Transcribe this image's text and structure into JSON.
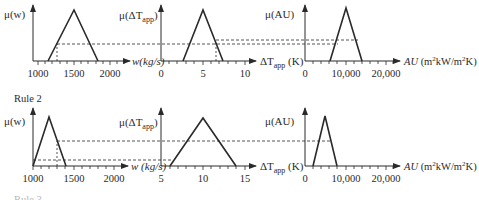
{
  "figure": {
    "rules": [
      {
        "label": "",
        "panels": [
          {
            "y_label": "μ(w)",
            "x_label": "w (kg/s)",
            "ticks": [
              "1000",
              "1500",
              "2000"
            ],
            "triangle": {
              "left": 1150,
              "peak": 1500,
              "right": 1850
            },
            "input_value": 1250,
            "activation": 0.35
          },
          {
            "y_label": "μ(ΔT_app)",
            "x_label": "ΔT_app (K)",
            "ticks": [
              "0",
              "5",
              "10"
            ],
            "triangle": {
              "left": 2.5,
              "peak": 5,
              "right": 7.5
            },
            "input_value": 6.8,
            "activation": 0.4
          },
          {
            "y_label": "μ(AU)",
            "x_label": "AU (m²kW/m²K)",
            "ticks": [
              "0",
              "10,000",
              "20,000"
            ],
            "triangle": {
              "left": 6000,
              "peak": 10000,
              "right": 14000
            },
            "activation": 0.35
          }
        ]
      },
      {
        "label": "Rule 2",
        "panels": [
          {
            "y_label": "μ(w)",
            "x_label": "w (kg/s)",
            "ticks": [
              "1000",
              "1500",
              "2000"
            ],
            "triangle": {
              "left": 1000,
              "peak": 1200,
              "right": 1400
            },
            "input_value": 1250,
            "activation": 0.1
          },
          {
            "y_label": "μ(ΔT_app)",
            "x_label": "ΔT_app (K)",
            "ticks": [
              "5",
              "10",
              "15"
            ],
            "triangle": {
              "left": 6,
              "peak": 10,
              "right": 14
            },
            "activation": 0.1
          },
          {
            "y_label": "μ(AU)",
            "x_label": "AU (m²kW/m²K)",
            "ticks": [
              "0",
              "10,000",
              "20,000"
            ],
            "triangle": {
              "left": 2500,
              "peak": 5000,
              "right": 7500
            },
            "activation": 0.55
          }
        ]
      }
    ],
    "next_rule_label": "Rule 3"
  },
  "labels": {
    "r1": {
      "p1_y": "μ(w)",
      "p2_y_mu": "μ(ΔT",
      "p2_y_sub": "app",
      "p3_y": "μ(AU)",
      "p1_x": "w(kg/s)",
      "p2_x_main": "ΔT",
      "p2_x_sub": "app",
      "p2_x_unit": " (K)",
      "p3_x_main": "AU",
      "p3_x_unit_a": " (m",
      "p3_x_unit_b": "kW/m",
      "p3_x_unit_c": "K)",
      "p1_t": [
        "1000",
        "1500",
        "2000"
      ],
      "p2_t": [
        "0",
        "5",
        "10"
      ],
      "p3_t": [
        "0",
        "10,000",
        "20,000"
      ]
    },
    "r2": {
      "title": "Rule 2",
      "p1_y": "μ(w)",
      "p2_y_mu": "μ(ΔT",
      "p2_y_sub": "app",
      "p3_y": "μ(AU)",
      "p1_x": "w (kg/s)",
      "p2_x_main": "ΔT",
      "p2_x_sub": "app",
      "p2_x_unit": " (K)",
      "p3_x_main": "AU",
      "p3_x_unit_a": " (m",
      "p3_x_unit_b": "kW/m",
      "p3_x_unit_c": "K)",
      "p1_t": [
        "1000",
        "1500",
        "2000"
      ],
      "p2_t": [
        "5",
        "10",
        "15"
      ],
      "p3_t": [
        "0",
        "10,000",
        "20,000"
      ]
    },
    "sup2": "2",
    "closing_paren": ")",
    "r3_title": "Rule 3"
  }
}
